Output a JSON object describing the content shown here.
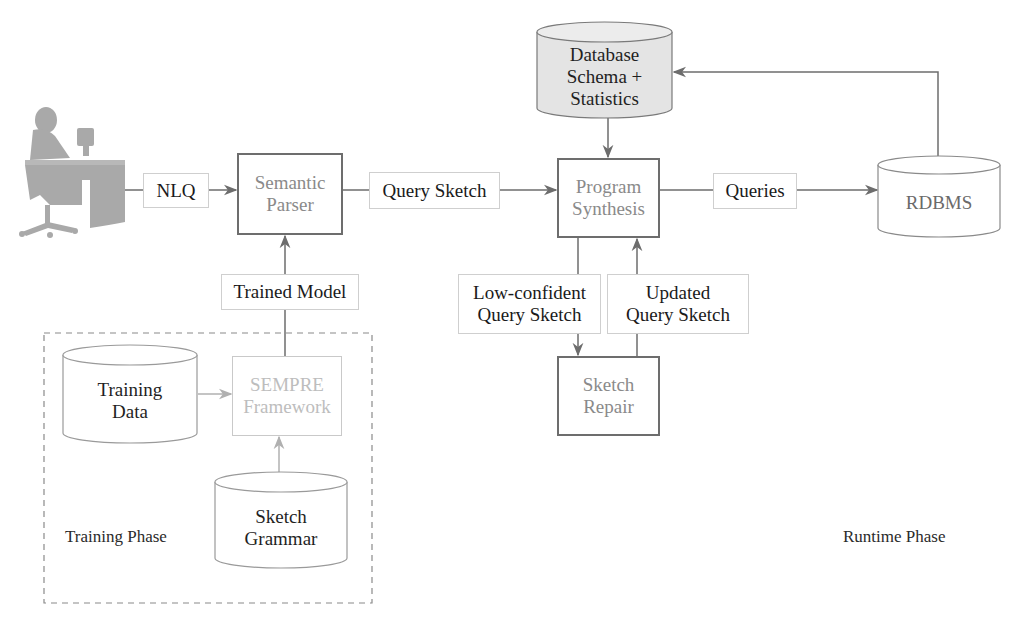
{
  "diagram": {
    "user": {
      "icon": "person-at-computer-icon"
    },
    "nlq_label": "NLQ",
    "semantic_parser": {
      "line1": "Semantic",
      "line2": "Parser"
    },
    "query_sketch_label": "Query Sketch",
    "program_synthesis": {
      "line1": "Program",
      "line2": "Synthesis"
    },
    "queries_label": "Queries",
    "rdbms": {
      "label": "RDBMS"
    },
    "db_schema": {
      "line1": "Database",
      "line2": "Schema +",
      "line3": "Statistics"
    },
    "low_confident": {
      "line1": "Low-confident",
      "line2": "Query Sketch"
    },
    "updated": {
      "line1": "Updated",
      "line2": "Query Sketch"
    },
    "sketch_repair": {
      "line1": "Sketch",
      "line2": "Repair"
    },
    "trained_model_label": "Trained Model",
    "training_data": {
      "line1": "Training",
      "line2": "Data"
    },
    "sempre": {
      "line1": "SEMPRE",
      "line2": "Framework"
    },
    "sketch_grammar": {
      "line1": "Sketch",
      "line2": "Grammar"
    },
    "training_phase_label": "Training Phase",
    "runtime_phase_label": "Runtime Phase",
    "colors": {
      "line": "#6d6d6d",
      "faint_line": "#b5b5b5",
      "cylinder_fill_highlight": "#e4e4e4",
      "user_silhouette": "#a9a9a9"
    }
  }
}
